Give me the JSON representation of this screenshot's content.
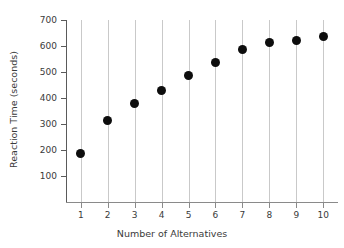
{
  "chart_data": {
    "type": "scatter",
    "title": "",
    "xlabel": "Number of Alternatives",
    "ylabel": "Reaction Time (seconds)",
    "x": [
      1,
      2,
      3,
      4,
      5,
      6,
      7,
      8,
      9,
      10
    ],
    "values": [
      185,
      312,
      377,
      427,
      488,
      535,
      588,
      612,
      623,
      635
    ],
    "xtick_labels": [
      "1",
      "2",
      "3",
      "4",
      "5",
      "6",
      "7",
      "8",
      "9",
      "10"
    ],
    "ytick_labels": [
      "100",
      "200",
      "300",
      "400",
      "500",
      "600",
      "700"
    ],
    "yticks": [
      100,
      200,
      300,
      400,
      500,
      600,
      700
    ],
    "xlim": [
      0.45,
      10.55
    ],
    "ylim": [
      0,
      700
    ],
    "grid": "vertical-only",
    "legend": "none",
    "marker": "filled-circle",
    "marker_color": "#0d0d0d",
    "gridline_color": "#c9c9c9",
    "axis_color": "#5a5a5a",
    "background_color": "#ffffff"
  }
}
